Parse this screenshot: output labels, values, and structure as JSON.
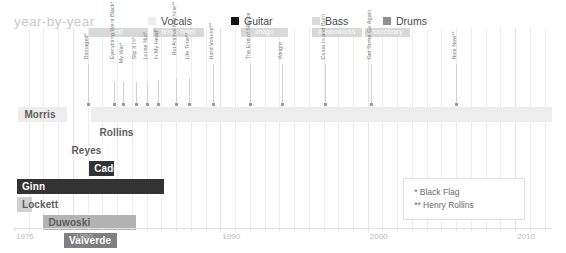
{
  "header": {
    "title": "year-by-year"
  },
  "legend": {
    "items": [
      {
        "label": "Vocals",
        "color": "#ededed",
        "x": 0
      },
      {
        "label": "Guitar",
        "color": "#111111",
        "x": 83
      },
      {
        "label": "Bass",
        "color": "#d9d9d9",
        "x": 164
      },
      {
        "label": "Drums",
        "color": "#8f8f8f",
        "x": 235
      }
    ]
  },
  "axis": {
    "min": 1976,
    "max": 2012.5,
    "ticks": [
      {
        "year": 1976,
        "label": "1976"
      },
      {
        "year": 1980,
        "label": "1980"
      },
      {
        "year": 1990,
        "label": "1990"
      },
      {
        "year": 2000,
        "label": "2000"
      },
      {
        "year": 2010,
        "label": "2010"
      }
    ],
    "gridlines": [
      1977,
      1978,
      1979,
      1980,
      1981,
      1982,
      1983,
      1984,
      1985,
      1986,
      1987,
      1988,
      1989,
      1990,
      1991,
      1992,
      1993,
      1994,
      1995,
      1996,
      1997,
      1998,
      1999,
      2000,
      2001,
      2002,
      2003,
      2004,
      2005,
      2006,
      2007,
      2008,
      2009,
      2010,
      2011,
      2012
    ],
    "major_gridlines": [
      1980,
      1990,
      2000,
      2010
    ]
  },
  "publishers": [
    {
      "name": "ssf",
      "start": 1981.1,
      "end": 1985.1
    },
    {
      "name": "texas hotel",
      "start": 1985.4,
      "end": 1988.9
    },
    {
      "name": "imago",
      "start": 1991.4,
      "end": 1994.6
    },
    {
      "name": "dreamworks",
      "start": 1996.2,
      "end": 1999.6
    },
    {
      "name": "sanctuary",
      "start": 1999.8,
      "end": 2002.9
    }
  ],
  "albums": [
    {
      "title": "Damaged*",
      "year": 1981.0,
      "stem": 40,
      "text_offset": 44,
      "leader": false
    },
    {
      "title": "Everything Went Black*",
      "year": 1982.8,
      "stem": 22,
      "text_offset": 44,
      "leader": true,
      "leader_to": 1982.8
    },
    {
      "title": "My War*",
      "year": 1983.4,
      "stem": 22,
      "text_offset": 40,
      "leader": true,
      "leader_to": 1983.4
    },
    {
      "title": "Slip It In*",
      "year": 1984.3,
      "stem": 22,
      "text_offset": 44,
      "leader": true,
      "leader_to": 1984.3
    },
    {
      "title": "Loose Nut*",
      "year": 1985.0,
      "stem": 22,
      "text_offset": 44,
      "leader": true,
      "leader_to": 1985.0
    },
    {
      "title": "In My Head*",
      "year": 1985.8,
      "stem": 24,
      "text_offset": 44,
      "leader": true,
      "leader_to": 1985.8
    },
    {
      "title": "Hot Animal Machine**",
      "year": 1987.0,
      "stem": 26,
      "text_offset": 48,
      "leader": true,
      "leader_to": 1987.0
    },
    {
      "title": "Life Time**",
      "year": 1987.9,
      "stem": 26,
      "text_offset": 44,
      "leader": true,
      "leader_to": 1987.9
    },
    {
      "title": "Hard Volume**",
      "year": 1989.5,
      "stem": 40,
      "text_offset": 44,
      "leader": false
    },
    {
      "title": "The End of Silence",
      "year": 1992.0,
      "stem": 40,
      "text_offset": 44,
      "leader": false
    },
    {
      "title": "Weight",
      "year": 1994.2,
      "stem": 40,
      "text_offset": 44,
      "leader": false
    },
    {
      "title": "Come In and Burn",
      "year": 1997.1,
      "stem": 40,
      "text_offset": 44,
      "leader": false
    },
    {
      "title": "Get Some Go Again",
      "year": 2000.2,
      "stem": 40,
      "text_offset": 44,
      "leader": false
    },
    {
      "title": "Nice Now**",
      "year": 2006.0,
      "stem": 40,
      "text_offset": 44,
      "leader": false
    }
  ],
  "members": [
    {
      "name": "Morris",
      "instrument": "Vocals",
      "color": "#ededed",
      "text_color": "onlight",
      "segments": [
        {
          "start": 1976.3,
          "end": 1979.6
        },
        {
          "start": 1981.2,
          "end": 2012.5
        }
      ],
      "label_on": 0,
      "label_pad": 6
    },
    {
      "name": "Rollins",
      "instrument": "Vocals",
      "color": "#ededed",
      "text_color": "onlight",
      "segments": [],
      "label_on": 1,
      "label_pad": 6,
      "label_year": 1981.8
    },
    {
      "name": "Reyes",
      "instrument": "Vocals",
      "color": "#ffffff",
      "text_color": "onlight",
      "segments": [],
      "label_on": -1,
      "label_year": 1979.9
    },
    {
      "name": "Cadena",
      "instrument": "Vocals",
      "color": "#333333",
      "text_color": "ondark",
      "segments": [
        {
          "start": 1981.1,
          "end": 1982.8
        }
      ],
      "label_on": 0,
      "label_pad": 5
    },
    {
      "name": "Ginn",
      "instrument": "Guitar",
      "color": "#333333",
      "text_color": "ondark",
      "segments": [
        {
          "start": 1976.2,
          "end": 1986.2
        }
      ],
      "label_on": 0,
      "label_pad": 5
    },
    {
      "name": "Lockett",
      "instrument": "Guitar",
      "color": "#d0d0d0",
      "text_color": "onlight",
      "segments": [
        {
          "start": 1976.2,
          "end": 1977.2
        }
      ],
      "label_on": 0,
      "label_pad": 5
    },
    {
      "name": "Duwoski",
      "instrument": "Bass",
      "color": "#b3b3b3",
      "text_color": "onlight",
      "segments": [
        {
          "start": 1978.0,
          "end": 1984.3
        }
      ],
      "label_on": 0,
      "label_pad": 5
    },
    {
      "name": "Valverde",
      "instrument": "Drums",
      "color": "#808080",
      "text_color": "ondark",
      "segments": [
        {
          "start": 1979.4,
          "end": 1983.0
        }
      ],
      "label_on": 0,
      "label_pad": 5
    }
  ],
  "footnote": {
    "lines": [
      "* Black Flag",
      "** Henry Rollins"
    ]
  }
}
